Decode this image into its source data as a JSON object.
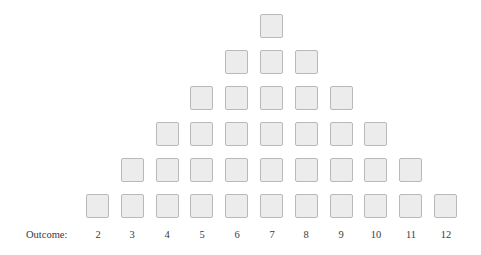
{
  "axis_label": "Outcome:",
  "outcomes": [
    {
      "label": "2",
      "count": 1
    },
    {
      "label": "3",
      "count": 2
    },
    {
      "label": "4",
      "count": 3
    },
    {
      "label": "5",
      "count": 4
    },
    {
      "label": "6",
      "count": 5
    },
    {
      "label": "7",
      "count": 6
    },
    {
      "label": "8",
      "count": 5
    },
    {
      "label": "9",
      "count": 4
    },
    {
      "label": "10",
      "count": 3
    },
    {
      "label": "11",
      "count": 2
    },
    {
      "label": "12",
      "count": 1
    }
  ],
  "colors": {
    "box_fill": "#ececec",
    "box_border": "#b9b9b9",
    "text": "#3a3a3a"
  }
}
